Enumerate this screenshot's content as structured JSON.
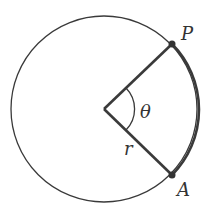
{
  "diagram": {
    "labels": {
      "point_p": "P",
      "point_a": "A",
      "angle": "θ",
      "radius": "r"
    },
    "colors": {
      "stroke": "#3a3a3a",
      "background": "#ffffff"
    }
  }
}
